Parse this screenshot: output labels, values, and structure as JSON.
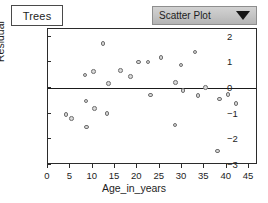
{
  "window": {
    "tab_label": "Trees"
  },
  "toolbar": {
    "plot_type_label": "Scatter Plot",
    "caret_icon": "chevron-down-icon"
  },
  "chart_data": {
    "type": "scatter",
    "title": "",
    "xlabel": "Age_in_years",
    "ylabel": "Residual",
    "xlim": [
      0,
      47
    ],
    "ylim": [
      -3,
      2.3
    ],
    "xticks": [
      0,
      5,
      10,
      15,
      20,
      25,
      30,
      35,
      40,
      45
    ],
    "yticks": [
      2,
      1,
      0,
      -1,
      -2,
      -3
    ],
    "ytick_labels": [
      "2",
      "1",
      "0",
      "−1",
      "−2",
      "−3"
    ],
    "grid": false,
    "legend": false,
    "reference_line": {
      "axis": "y",
      "value": 0
    },
    "marker": {
      "shape": "circle",
      "fill": "#d8d8d8",
      "edge": "#6e6e6e",
      "size": 4.6
    },
    "points": [
      {
        "x": 4.0,
        "y": -1.03
      },
      {
        "x": 5.2,
        "y": -1.18
      },
      {
        "x": 8.3,
        "y": 0.5
      },
      {
        "x": 8.5,
        "y": -0.5
      },
      {
        "x": 8.6,
        "y": -1.52
      },
      {
        "x": 10.2,
        "y": 0.64
      },
      {
        "x": 10.4,
        "y": -0.8
      },
      {
        "x": 12.3,
        "y": 1.73
      },
      {
        "x": 13.2,
        "y": -1.0
      },
      {
        "x": 13.6,
        "y": 0.17
      },
      {
        "x": 16.2,
        "y": 0.69
      },
      {
        "x": 18.4,
        "y": 0.44
      },
      {
        "x": 20.2,
        "y": 1.01
      },
      {
        "x": 22.4,
        "y": 1.01
      },
      {
        "x": 23.0,
        "y": -0.27
      },
      {
        "x": 25.3,
        "y": 1.2
      },
      {
        "x": 28.4,
        "y": -1.44
      },
      {
        "x": 28.6,
        "y": 0.21
      },
      {
        "x": 29.8,
        "y": 0.9
      },
      {
        "x": 30.2,
        "y": -0.1
      },
      {
        "x": 32.9,
        "y": 1.4
      },
      {
        "x": 33.6,
        "y": -0.29
      },
      {
        "x": 35.2,
        "y": 0.02
      },
      {
        "x": 38.0,
        "y": -2.45
      },
      {
        "x": 38.4,
        "y": -0.43
      },
      {
        "x": 40.3,
        "y": -0.25
      },
      {
        "x": 42.1,
        "y": -0.61
      }
    ]
  }
}
